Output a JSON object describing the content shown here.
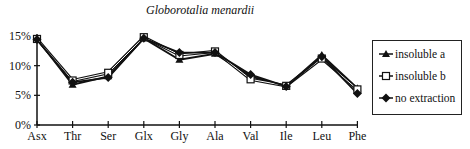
{
  "chart_data": {
    "type": "line",
    "title": "Globorotalia menardii",
    "xlabel": "",
    "ylabel": "",
    "categories": [
      "Asx",
      "Thr",
      "Ser",
      "Glx",
      "Gly",
      "Ala",
      "Val",
      "Ile",
      "Leu",
      "Phe"
    ],
    "yticks": [
      "0%",
      "5%",
      "10%",
      "15%"
    ],
    "ylim": [
      0,
      15
    ],
    "grid": false,
    "legend_position": "right",
    "series": [
      {
        "name": "insoluble a",
        "marker": "triangle-filled",
        "values": [
          14.5,
          6.8,
          8.2,
          14.6,
          11.0,
          12.0,
          8.2,
          6.5,
          11.8,
          6.2
        ]
      },
      {
        "name": "insoluble b",
        "marker": "square-open",
        "values": [
          14.5,
          7.5,
          8.8,
          14.8,
          11.8,
          12.4,
          7.7,
          6.6,
          11.2,
          6.0
        ]
      },
      {
        "name": "no extraction",
        "marker": "diamond-filled",
        "values": [
          14.4,
          7.2,
          8.0,
          14.6,
          12.2,
          12.2,
          8.5,
          6.5,
          11.5,
          5.3
        ]
      }
    ]
  },
  "legend": {
    "items": [
      {
        "label": "insoluble a",
        "icon": "triangle-filled-icon"
      },
      {
        "label": "insoluble b",
        "icon": "square-open-icon"
      },
      {
        "label": "no extraction",
        "icon": "diamond-filled-icon"
      }
    ]
  }
}
